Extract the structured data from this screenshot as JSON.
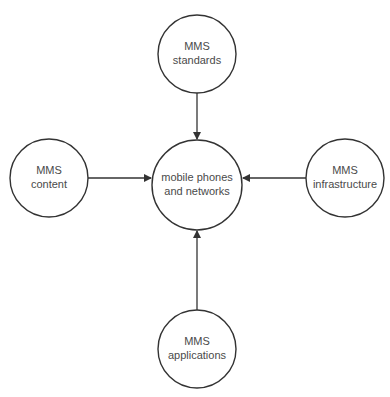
{
  "diagram": {
    "type": "hub-and-spoke",
    "colors": {
      "stroke": "#333333",
      "fill": "#ffffff",
      "text": "#4a4a4a"
    },
    "center": {
      "id": "center",
      "line1": "mobile phones",
      "line2": "and networks"
    },
    "nodes": [
      {
        "id": "top",
        "line1": "MMS",
        "line2": "standards"
      },
      {
        "id": "left",
        "line1": "MMS",
        "line2": "content"
      },
      {
        "id": "right",
        "line1": "MMS",
        "line2": "infrastructure"
      },
      {
        "id": "bottom",
        "line1": "MMS",
        "line2": "applications"
      }
    ],
    "edges": [
      {
        "from": "top",
        "to": "center"
      },
      {
        "from": "left",
        "to": "center"
      },
      {
        "from": "right",
        "to": "center"
      },
      {
        "from": "bottom",
        "to": "center"
      }
    ]
  }
}
